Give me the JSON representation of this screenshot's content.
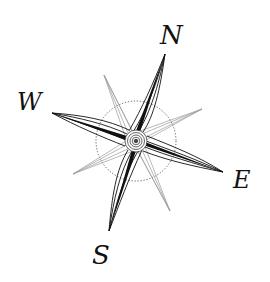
{
  "diagram": {
    "type": "compass-rose",
    "center": [
      136,
      141
    ],
    "circle_radius": 40,
    "cardinals": [
      {
        "label": "N",
        "tip": [
          165,
          54
        ],
        "letter_pos": [
          162,
          24
        ]
      },
      {
        "label": "E",
        "tip": [
          223,
          172
        ],
        "letter_pos": [
          233,
          170
        ]
      },
      {
        "label": "S",
        "tip": [
          109,
          231
        ],
        "letter_pos": [
          91,
          245
        ]
      },
      {
        "label": "W",
        "tip": [
          52,
          113
        ],
        "letter_pos": [
          18,
          91
        ]
      }
    ],
    "intercardinals": [
      {
        "tip": [
          104,
          75
        ]
      },
      {
        "tip": [
          202,
          109
        ]
      },
      {
        "tip": [
          170,
          211
        ]
      },
      {
        "tip": [
          73,
          174
        ]
      }
    ],
    "colors": {
      "ink": "#111111",
      "light_ray": "#9a9a9a",
      "background": "#ffffff"
    }
  }
}
